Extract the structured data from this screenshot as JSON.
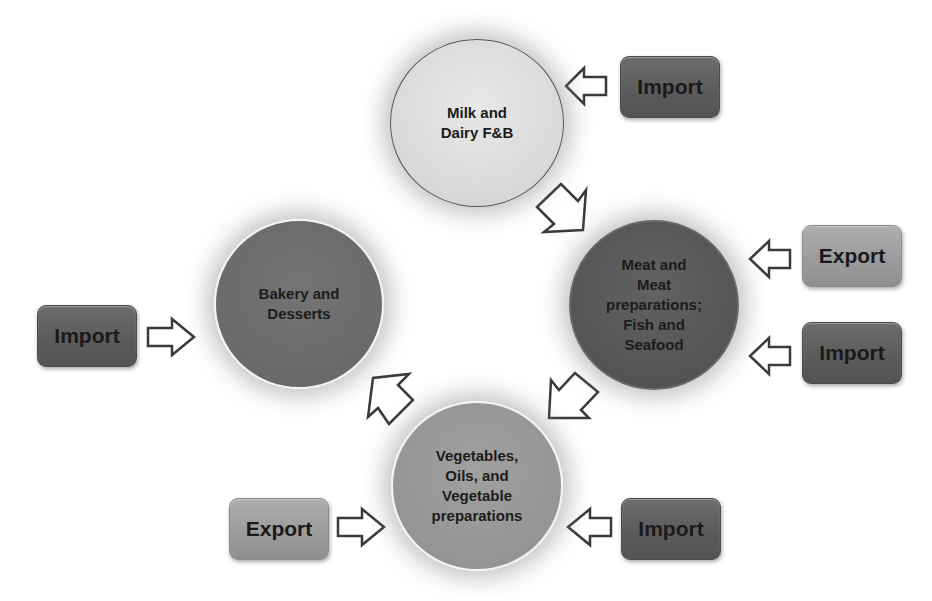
{
  "diagram": {
    "nodes": [
      {
        "id": "milk",
        "label": "Milk and\nDairy F&B",
        "fill": "#d9d9d9"
      },
      {
        "id": "meat",
        "label": "Meat and\nMeat\npreparations;\nFish and\nSeafood",
        "fill": "#555555"
      },
      {
        "id": "veg",
        "label": "Vegetables,\nOils, and\nVegetable\npreparations",
        "fill": "#969696"
      },
      {
        "id": "bakery",
        "label": "Bakery and\nDesserts",
        "fill": "#6b6b6b"
      }
    ],
    "boxes": [
      {
        "id": "milk-import",
        "label": "Import",
        "target": "milk",
        "fill": "#5e5e5e"
      },
      {
        "id": "meat-export",
        "label": "Export",
        "target": "meat",
        "fill": "#9c9c9c"
      },
      {
        "id": "meat-import",
        "label": "Import",
        "target": "meat",
        "fill": "#5e5e5e"
      },
      {
        "id": "bakery-import",
        "label": "Import",
        "target": "bakery",
        "fill": "#5e5e5e"
      },
      {
        "id": "veg-export",
        "label": "Export",
        "target": "veg",
        "fill": "#9c9c9c"
      },
      {
        "id": "veg-import",
        "label": "Import",
        "target": "veg",
        "fill": "#5e5e5e"
      }
    ],
    "cycle_arrows": [
      {
        "from": "milk",
        "to": "meat"
      },
      {
        "from": "meat",
        "to": "veg"
      },
      {
        "from": "veg",
        "to": "bakery"
      }
    ]
  }
}
